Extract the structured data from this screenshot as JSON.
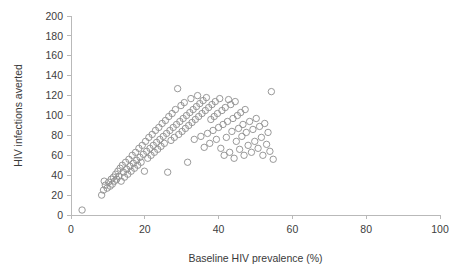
{
  "chart_data": {
    "type": "scatter",
    "title": "",
    "xlabel": "Baseline HIV prevalence (%)",
    "ylabel": "HIV infections averted",
    "xlim": [
      0,
      100
    ],
    "ylim": [
      0,
      200
    ],
    "xticks": [
      0,
      20,
      40,
      60,
      80,
      100
    ],
    "yticks": [
      0,
      20,
      40,
      60,
      80,
      100,
      120,
      140,
      160,
      180,
      200
    ],
    "grid": false,
    "legend": null,
    "marker": {
      "shape": "circle-open",
      "color": "#8d8d8d",
      "size": 3.2
    },
    "series": [
      {
        "name": "modelled settings",
        "points": [
          [
            3.0,
            5
          ],
          [
            8.3,
            20
          ],
          [
            8.8,
            25
          ],
          [
            9.3,
            30
          ],
          [
            9.0,
            34
          ],
          [
            9.8,
            27
          ],
          [
            10.2,
            33
          ],
          [
            10.6,
            29
          ],
          [
            10.9,
            36
          ],
          [
            11.2,
            31
          ],
          [
            11.5,
            38
          ],
          [
            11.8,
            34
          ],
          [
            12.1,
            41
          ],
          [
            12.4,
            36
          ],
          [
            12.7,
            44
          ],
          [
            13.0,
            39
          ],
          [
            13.3,
            47
          ],
          [
            13.6,
            34
          ],
          [
            13.9,
            50
          ],
          [
            14.2,
            43
          ],
          [
            14.5,
            38
          ],
          [
            14.8,
            53
          ],
          [
            15.1,
            46
          ],
          [
            15.4,
            41
          ],
          [
            15.7,
            56
          ],
          [
            16.0,
            49
          ],
          [
            16.3,
            44
          ],
          [
            16.6,
            60
          ],
          [
            16.9,
            52
          ],
          [
            17.2,
            47
          ],
          [
            17.5,
            63
          ],
          [
            17.8,
            55
          ],
          [
            18.1,
            50
          ],
          [
            18.4,
            67
          ],
          [
            18.7,
            58
          ],
          [
            19.0,
            53
          ],
          [
            19.3,
            70
          ],
          [
            19.6,
            61
          ],
          [
            19.9,
            44
          ],
          [
            20.2,
            74
          ],
          [
            20.5,
            64
          ],
          [
            20.8,
            57
          ],
          [
            21.1,
            78
          ],
          [
            21.4,
            67
          ],
          [
            21.7,
            60
          ],
          [
            22.0,
            81
          ],
          [
            22.3,
            70
          ],
          [
            22.6,
            63
          ],
          [
            22.9,
            85
          ],
          [
            23.2,
            73
          ],
          [
            23.5,
            66
          ],
          [
            23.8,
            88
          ],
          [
            24.1,
            76
          ],
          [
            24.4,
            69
          ],
          [
            24.7,
            92
          ],
          [
            25.0,
            79
          ],
          [
            25.3,
            72
          ],
          [
            25.6,
            95
          ],
          [
            25.9,
            82
          ],
          [
            26.2,
            43
          ],
          [
            26.5,
            99
          ],
          [
            26.8,
            85
          ],
          [
            27.1,
            75
          ],
          [
            27.4,
            102
          ],
          [
            27.7,
            88
          ],
          [
            28.0,
            78
          ],
          [
            28.3,
            106
          ],
          [
            28.6,
            91
          ],
          [
            28.9,
            127
          ],
          [
            29.2,
            81
          ],
          [
            29.5,
            94
          ],
          [
            29.8,
            110
          ],
          [
            30.1,
            84
          ],
          [
            30.4,
            97
          ],
          [
            30.7,
            113
          ],
          [
            31.0,
            87
          ],
          [
            31.3,
            100
          ],
          [
            31.6,
            53
          ],
          [
            31.9,
            90
          ],
          [
            32.2,
            103
          ],
          [
            32.5,
            117
          ],
          [
            32.8,
            93
          ],
          [
            33.1,
            106
          ],
          [
            33.4,
            76
          ],
          [
            33.7,
            96
          ],
          [
            34.0,
            109
          ],
          [
            34.3,
            120
          ],
          [
            34.6,
            99
          ],
          [
            34.9,
            112
          ],
          [
            35.2,
            79
          ],
          [
            35.5,
            102
          ],
          [
            35.8,
            115
          ],
          [
            36.1,
            68
          ],
          [
            36.4,
            105
          ],
          [
            36.7,
            118
          ],
          [
            37.0,
            82
          ],
          [
            37.3,
            108
          ],
          [
            37.6,
            72
          ],
          [
            37.9,
            96
          ],
          [
            38.2,
            111
          ],
          [
            38.5,
            85
          ],
          [
            38.8,
            99
          ],
          [
            39.1,
            114
          ],
          [
            39.4,
            76
          ],
          [
            39.7,
            102
          ],
          [
            40.0,
            88
          ],
          [
            40.3,
            117
          ],
          [
            40.6,
            67
          ],
          [
            40.9,
            105
          ],
          [
            41.2,
            91
          ],
          [
            41.5,
            60
          ],
          [
            41.8,
            108
          ],
          [
            42.1,
            78
          ],
          [
            42.4,
            94
          ],
          [
            42.7,
            116
          ],
          [
            43.0,
            63
          ],
          [
            43.3,
            111
          ],
          [
            43.6,
            84
          ],
          [
            43.9,
            97
          ],
          [
            44.2,
            57
          ],
          [
            44.5,
            114
          ],
          [
            44.8,
            74
          ],
          [
            45.1,
            100
          ],
          [
            45.4,
            87
          ],
          [
            45.7,
            66
          ],
          [
            46.0,
            103
          ],
          [
            46.3,
            79
          ],
          [
            46.6,
            91
          ],
          [
            46.9,
            60
          ],
          [
            47.2,
            106
          ],
          [
            47.5,
            83
          ],
          [
            48.0,
            70
          ],
          [
            48.4,
            94
          ],
          [
            48.9,
            63
          ],
          [
            49.3,
            86
          ],
          [
            49.8,
            74
          ],
          [
            50.2,
            97
          ],
          [
            50.7,
            67
          ],
          [
            51.1,
            89
          ],
          [
            51.6,
            78
          ],
          [
            52.0,
            60
          ],
          [
            52.5,
            92
          ],
          [
            53.0,
            71
          ],
          [
            53.4,
            83
          ],
          [
            53.9,
            64
          ],
          [
            54.3,
            124
          ],
          [
            54.8,
            56
          ]
        ]
      }
    ]
  }
}
